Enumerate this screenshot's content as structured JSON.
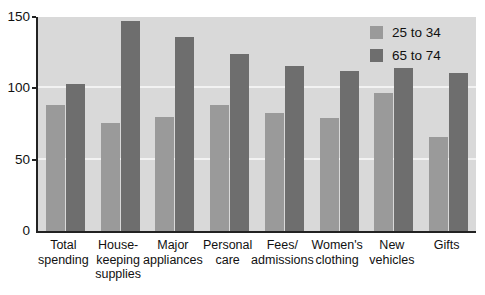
{
  "chart_data": {
    "type": "bar",
    "title": "",
    "xlabel": "",
    "ylabel": "",
    "ylim": [
      0,
      150
    ],
    "yticks": [
      0,
      50,
      100,
      150
    ],
    "grid": true,
    "legend_position": "top-right",
    "categories": [
      "Total\nspending",
      "House-\nkeeping\nsupplies",
      "Major\nappliances",
      "Personal\ncare",
      "Fees/\nadmissions",
      "Women's\nclothing",
      "New\nvehicles",
      "Gifts"
    ],
    "series": [
      {
        "name": "25 to 34",
        "color": "#9a9a9a",
        "values": [
          88,
          76,
          80,
          88,
          83,
          79,
          97,
          66
        ]
      },
      {
        "name": "65 to 74",
        "color": "#6e6e6e",
        "values": [
          103,
          147,
          136,
          124,
          116,
          112,
          114,
          111
        ]
      }
    ],
    "colors": {
      "plot_background": "#d9d9d9",
      "gridline": "#f2f2f2",
      "axis": "#222222",
      "page_background": "#ffffff"
    }
  }
}
